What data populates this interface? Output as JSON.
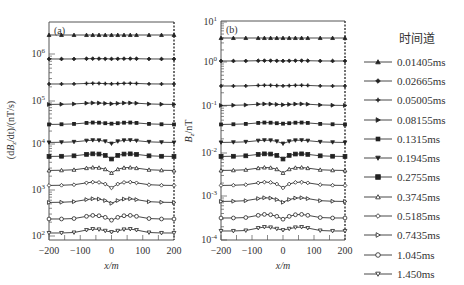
{
  "chart_data": [
    {
      "type": "line",
      "panel_label": "(a)",
      "xlabel": "x/m",
      "ylabel": "(dB_z/dt)/(nT/s)",
      "yscale": "log",
      "xlim": [
        -200,
        200
      ],
      "ylim_decades": [
        2,
        6.7
      ],
      "xticks": [
        -200,
        -100,
        0,
        100,
        200
      ],
      "yticks": [
        "10^2",
        "10^3",
        "10^4",
        "10^5",
        "10^6"
      ],
      "x": [
        -200,
        -160,
        -120,
        -80,
        -60,
        -40,
        -20,
        0,
        20,
        40,
        60,
        80,
        120,
        160,
        200
      ],
      "series_baseline_px": [
        35,
        59,
        84,
        104,
        124,
        142,
        156,
        170,
        185,
        202,
        219,
        233
      ],
      "series_shape": "flat edges, slight bulge near |x|=40-80, dip at x=0 for later channels"
    },
    {
      "type": "line",
      "panel_label": "(b)",
      "xlabel": "x/m",
      "ylabel": "B_z/nT",
      "yscale": "log",
      "xlim": [
        -200,
        200
      ],
      "ylim": [
        "10^-4",
        "10^1"
      ],
      "xticks": [
        -200,
        -100,
        0,
        100,
        200
      ],
      "yticks": [
        "10^-4",
        "10^-3",
        "10^-2",
        "10^-1",
        "10^0",
        "10^1"
      ],
      "x": [
        -200,
        -160,
        -120,
        -80,
        -60,
        -40,
        -20,
        0,
        20,
        40,
        60,
        80,
        120,
        160,
        200
      ],
      "series_baseline_px": [
        38,
        61,
        86,
        105,
        124,
        142,
        156,
        170,
        185,
        201,
        218,
        231
      ]
    }
  ],
  "legend": {
    "title": "时间道",
    "items": [
      {
        "label": "0.01405ms",
        "marker": "triangle-up"
      },
      {
        "label": "0.02665ms",
        "marker": "diamond"
      },
      {
        "label": "0.05005ms",
        "marker": "plus"
      },
      {
        "label": "0.08155ms",
        "marker": "triangle-right"
      },
      {
        "label": "0.1315ms",
        "marker": "x-square"
      },
      {
        "label": "0.1945ms",
        "marker": "triangle-down"
      },
      {
        "label": "0.2755ms",
        "marker": "square"
      },
      {
        "label": "0.3745ms",
        "marker": "triangle-up-open"
      },
      {
        "label": "0.5185ms",
        "marker": "diamond-open"
      },
      {
        "label": "0.7435ms",
        "marker": "triangle-right-open"
      },
      {
        "label": "1.045ms",
        "marker": "circle-open"
      },
      {
        "label": "1.450ms",
        "marker": "triangle-down-open"
      }
    ]
  },
  "labels": {
    "panel_a": "(a)",
    "panel_b": "(b)",
    "xlabel_a": "x/m",
    "xlabel_b": "x/m",
    "ylabel_a": "(dB_z/dt)/(nT/s)",
    "ylabel_b": "B_z/nT"
  }
}
